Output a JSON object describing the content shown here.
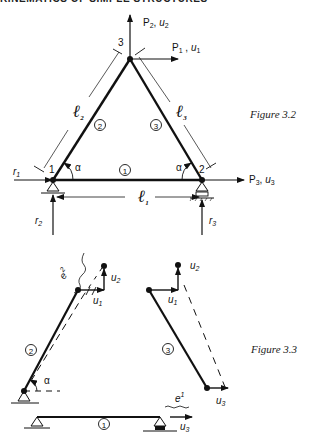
{
  "header": {
    "running_title": "KINEMATICS OF SIMPLE STRUCTURES"
  },
  "figure_3_2": {
    "caption": "Figure 3.2",
    "nodes": [
      "1",
      "2",
      "3"
    ],
    "members": [
      "1",
      "2",
      "3"
    ],
    "lengths": {
      "l1": "ℓ",
      "l1_sub": "1",
      "l2": "ℓ",
      "l2_sub": "2",
      "l3": "ℓ",
      "l3_sub": "3"
    },
    "angle": "α",
    "loads": {
      "p1": "P",
      "p1_sub": "1",
      "u1": "u",
      "u1_sub": "1",
      "p2": "P",
      "p2_sub": "2",
      "u2": "u",
      "u2_sub": "2",
      "p3": "P",
      "p3_sub": "3",
      "u3": "u",
      "u3_sub": "3"
    },
    "reactions": {
      "r1": "r",
      "r1_sub": "1",
      "r2": "r",
      "r2_sub": "2",
      "r3": "r",
      "r3_sub": "3"
    }
  },
  "figure_3_3": {
    "caption": "Figure 3.3",
    "members": [
      "2",
      "3",
      "1"
    ],
    "angle": "α",
    "strains": {
      "e2": "e",
      "e2_sup": "2",
      "e1": "e",
      "e1_sup": "1"
    },
    "displacements": {
      "u1": "u",
      "u1_sub": "1",
      "u2": "u",
      "u2_sub": "2",
      "u3": "u",
      "u3_sub": "3"
    }
  }
}
